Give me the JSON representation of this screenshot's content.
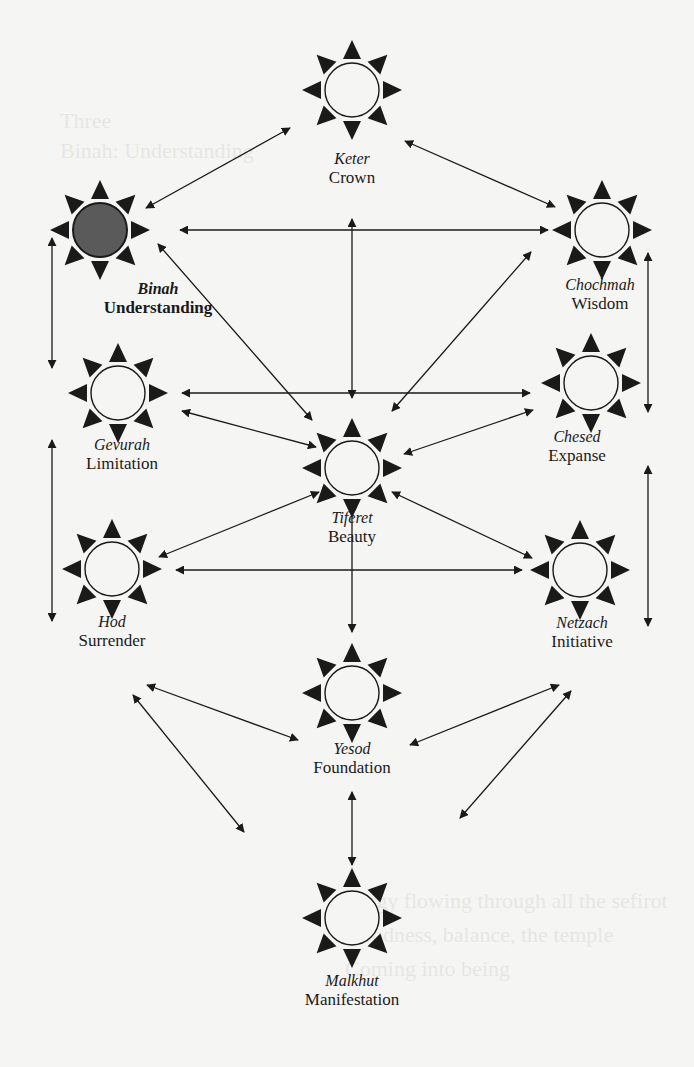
{
  "diagram": {
    "type": "tree-of-life-sefirot",
    "colors": {
      "background": "#f5f5f3",
      "ink": "#1a1a1a",
      "highlight_fill": "#5a5a5a",
      "node_fill": "#f5f5f3"
    },
    "nodes": [
      {
        "id": "keter",
        "hebrew": "Keter",
        "english": "Crown",
        "x": 352,
        "y": 90,
        "highlight": false,
        "bold": false
      },
      {
        "id": "binah",
        "hebrew": "Binah",
        "english": "Understanding",
        "x": 100,
        "y": 230,
        "highlight": true,
        "bold": true
      },
      {
        "id": "chochmah",
        "hebrew": "Chochmah",
        "english": "Wisdom",
        "x": 602,
        "y": 230,
        "highlight": false,
        "bold": false
      },
      {
        "id": "gevurah",
        "hebrew": "Gevurah",
        "english": "Limitation",
        "x": 118,
        "y": 393,
        "highlight": false,
        "bold": false
      },
      {
        "id": "chesed",
        "hebrew": "Chesed",
        "english": "Expanse",
        "x": 591,
        "y": 383,
        "highlight": false,
        "bold": false
      },
      {
        "id": "tiferet",
        "hebrew": "Tiferet",
        "english": "Beauty",
        "x": 352,
        "y": 468,
        "highlight": false,
        "bold": false
      },
      {
        "id": "hod",
        "hebrew": "Hod",
        "english": "Surrender",
        "x": 112,
        "y": 569,
        "highlight": false,
        "bold": false
      },
      {
        "id": "netzach",
        "hebrew": "Netzach",
        "english": "Initiative",
        "x": 580,
        "y": 570,
        "highlight": false,
        "bold": false
      },
      {
        "id": "yesod",
        "hebrew": "Yesod",
        "english": "Foundation",
        "x": 352,
        "y": 693,
        "highlight": false,
        "bold": false
      },
      {
        "id": "malkhut",
        "hebrew": "Malkhut",
        "english": "Manifestation",
        "x": 352,
        "y": 918,
        "highlight": false,
        "bold": false
      }
    ],
    "labels": [
      {
        "node": "keter",
        "x": 352,
        "y": 168,
        "bold": false
      },
      {
        "node": "binah",
        "x": 158,
        "y": 298,
        "bold": true
      },
      {
        "node": "chochmah",
        "x": 600,
        "y": 294,
        "bold": false
      },
      {
        "node": "gevurah",
        "x": 122,
        "y": 454,
        "bold": false
      },
      {
        "node": "chesed",
        "x": 577,
        "y": 446,
        "bold": false
      },
      {
        "node": "tiferet",
        "x": 352,
        "y": 527,
        "bold": false
      },
      {
        "node": "hod",
        "x": 112,
        "y": 631,
        "bold": false
      },
      {
        "node": "netzach",
        "x": 582,
        "y": 632,
        "bold": false
      },
      {
        "node": "yesod",
        "x": 352,
        "y": 758,
        "bold": false
      },
      {
        "node": "malkhut",
        "x": 352,
        "y": 990,
        "bold": false
      }
    ],
    "arrows": [
      {
        "from": [
          146,
          208
        ],
        "to": [
          290,
          128
        ],
        "heads": "both"
      },
      {
        "from": [
          405,
          141
        ],
        "to": [
          555,
          207
        ],
        "heads": "both"
      },
      {
        "from": [
          180,
          230
        ],
        "to": [
          548,
          230
        ],
        "heads": "both"
      },
      {
        "from": [
          352,
          219
        ],
        "to": [
          352,
          398
        ],
        "heads": "both"
      },
      {
        "from": [
          158,
          244
        ],
        "to": [
          312,
          420
        ],
        "heads": "both"
      },
      {
        "from": [
          531,
          252
        ],
        "to": [
          392,
          411
        ],
        "heads": "both"
      },
      {
        "from": [
          52,
          238
        ],
        "to": [
          52,
          368
        ],
        "heads": "both"
      },
      {
        "from": [
          182,
          393
        ],
        "to": [
          530,
          393
        ],
        "heads": "both"
      },
      {
        "from": [
          182,
          411
        ],
        "to": [
          316,
          447
        ],
        "heads": "both"
      },
      {
        "from": [
          533,
          410
        ],
        "to": [
          404,
          454
        ],
        "heads": "both"
      },
      {
        "from": [
          648,
          253
        ],
        "to": [
          648,
          412
        ],
        "heads": "both"
      },
      {
        "from": [
          52,
          440
        ],
        "to": [
          52,
          621
        ],
        "heads": "both"
      },
      {
        "from": [
          648,
          466
        ],
        "to": [
          648,
          626
        ],
        "heads": "both"
      },
      {
        "from": [
          319,
          492
        ],
        "to": [
          159,
          557
        ],
        "heads": "both"
      },
      {
        "from": [
          392,
          492
        ],
        "to": [
          532,
          558
        ],
        "heads": "both"
      },
      {
        "from": [
          176,
          570
        ],
        "to": [
          522,
          570
        ],
        "heads": "both"
      },
      {
        "from": [
          352,
          501
        ],
        "to": [
          352,
          632
        ],
        "heads": "both"
      },
      {
        "from": [
          147,
          685
        ],
        "to": [
          298,
          740
        ],
        "heads": "both"
      },
      {
        "from": [
          559,
          685
        ],
        "to": [
          410,
          745
        ],
        "heads": "both"
      },
      {
        "from": [
          133,
          695
        ],
        "to": [
          244,
          832
        ],
        "heads": "both"
      },
      {
        "from": [
          571,
          691
        ],
        "to": [
          460,
          818
        ],
        "heads": "both"
      },
      {
        "from": [
          352,
          792
        ],
        "to": [
          352,
          865
        ],
        "heads": "both"
      }
    ]
  },
  "bleed_through": {
    "lines": [
      {
        "text": "Three",
        "x": 60,
        "y": 128
      },
      {
        "text": "Binah: Understanding",
        "x": 60,
        "y": 158
      },
      {
        "text": "Energy flowing through all the sefirot",
        "x": 335,
        "y": 908
      },
      {
        "text": "Goodness, balance, the temple",
        "x": 345,
        "y": 942
      },
      {
        "text": "Coming into being",
        "x": 345,
        "y": 976
      }
    ]
  }
}
